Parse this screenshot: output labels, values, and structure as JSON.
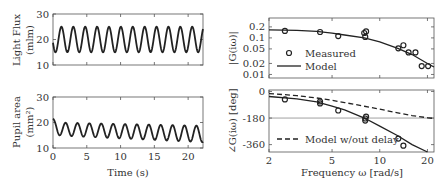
{
  "chart_data": [
    {
      "id": "light",
      "type": "line",
      "title": "",
      "xlabel": "",
      "ylabel": "Light Flux",
      "ylabel2": "(mlm)",
      "xlim": [
        0,
        22.2
      ],
      "ylim": [
        10,
        30
      ],
      "yticks": [
        "10",
        "20",
        "30"
      ],
      "yticks_values": [
        10,
        20,
        30
      ],
      "xticks_values": [
        0,
        5,
        10,
        15,
        20
      ],
      "series": [
        {
          "name": "Light flux",
          "kind": "sine",
          "mean": 20,
          "amplitude": 5,
          "period_s": 1.76,
          "phase": 3.4
        }
      ]
    },
    {
      "id": "pupil",
      "type": "line",
      "xlabel": "Time (s)",
      "ylabel": "Pupil area",
      "ylabel2": "(mm²)",
      "xlim": [
        0,
        22.2
      ],
      "ylim": [
        10,
        30
      ],
      "yticks": [
        "10",
        "20",
        "30"
      ],
      "yticks_values": [
        10,
        20,
        30
      ],
      "xticks": [
        "0",
        "5",
        "10",
        "15",
        "20"
      ],
      "xticks_values": [
        0,
        5,
        10,
        15,
        20
      ],
      "series": [
        {
          "name": "Pupil area",
          "kind": "damped-sine",
          "mean_start": 17.5,
          "mean_end": 15.5,
          "amp_start": 2.5,
          "amp_end": 3.2,
          "period_s": 1.76,
          "start_value": 21.5
        }
      ]
    },
    {
      "id": "magnitude",
      "type": "scatter",
      "ylabel": "|G(iω)|",
      "xscale": "log",
      "yscale": "log",
      "xlim": [
        2,
        22
      ],
      "ylim": [
        0.008,
        0.35
      ],
      "yticks": [
        "0.2",
        "0.1",
        "0.05",
        "0.02",
        "0.01"
      ],
      "yticks_values": [
        0.2,
        0.1,
        0.05,
        0.02,
        0.01
      ],
      "xticks_values": [
        2,
        5,
        10,
        20
      ],
      "legend": {
        "position": "bottom-left",
        "entries": [
          "Measured",
          "Model"
        ]
      },
      "series": [
        {
          "name": "Measured",
          "marker": "circle",
          "x": [
            2.52,
            4.2,
            5.47,
            7.98,
            8.2,
            8.1,
            13.1,
            14.1,
            15.2,
            16.8,
            18.4,
            20.2
          ],
          "y": [
            0.155,
            0.145,
            0.112,
            0.136,
            0.15,
            0.106,
            0.052,
            0.063,
            0.04,
            0.04,
            0.017,
            0.017
          ]
        },
        {
          "name": "Model",
          "line": "solid",
          "x": [
            2,
            3,
            4,
            5,
            6,
            8,
            10,
            13,
            16,
            20,
            22
          ],
          "y": [
            0.165,
            0.16,
            0.15,
            0.135,
            0.12,
            0.1,
            0.078,
            0.052,
            0.035,
            0.02,
            0.016
          ]
        }
      ]
    },
    {
      "id": "phase",
      "type": "scatter",
      "ylabel": "∠G(iω) [deg]",
      "xlabel": "Frequency ω [rad/s]",
      "xscale": "log",
      "xlim": [
        2,
        22
      ],
      "ylim": [
        -410,
        10
      ],
      "yticks": [
        "0",
        "-180",
        "-360"
      ],
      "yticks_values": [
        0,
        -180,
        -360
      ],
      "xticks": [
        "2",
        "5",
        "10",
        "20"
      ],
      "xticks_values": [
        2,
        5,
        10,
        20
      ],
      "hline": -180,
      "legend": {
        "position": "bottom-left",
        "entries": [
          "Model w/out delay"
        ]
      },
      "series": [
        {
          "name": "Measured",
          "marker": "circle",
          "x": [
            2.52,
            4.2,
            4.2,
            5.47,
            8.1,
            8.2,
            8.1,
            13.1,
            14.1
          ],
          "y": [
            -54,
            -81,
            -68,
            -129,
            -183,
            -170,
            -197,
            -319,
            -367
          ]
        },
        {
          "name": "Model",
          "line": "solid",
          "x": [
            2,
            3,
            4,
            5,
            6,
            8,
            10,
            13,
            16,
            20
          ],
          "y": [
            -34,
            -50,
            -70,
            -100,
            -125,
            -180,
            -235,
            -300,
            -360,
            -420
          ]
        },
        {
          "name": "Model w/out delay",
          "line": "dashed",
          "x": [
            2,
            3,
            4,
            5,
            6,
            8,
            10,
            13,
            16,
            20,
            22
          ],
          "y": [
            -14,
            -28,
            -44,
            -60,
            -75,
            -100,
            -120,
            -145,
            -163,
            -178,
            -183
          ]
        }
      ]
    }
  ]
}
